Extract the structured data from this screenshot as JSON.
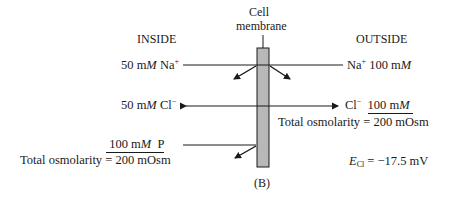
{
  "labels": {
    "inside": "INSIDE",
    "outside": "OUTSIDE",
    "membrane_line1": "Cell",
    "membrane_line2": "membrane",
    "panel": "(B)"
  },
  "inside": {
    "na": {
      "value": "50 m",
      "unit_italic": "M",
      "ion": " Na",
      "charge": "+"
    },
    "cl": {
      "value": "50 m",
      "unit_italic": "M",
      "ion": " Cl",
      "charge": "−"
    },
    "p": {
      "value": "100 m",
      "unit_italic": "M",
      "ion": "  P"
    },
    "osmolarity": "Total osmolarity = 200 mOsm"
  },
  "outside": {
    "na": {
      "ion": "Na",
      "charge": "+",
      "value": " 100 m",
      "unit_italic": "M"
    },
    "cl": {
      "ion": "Cl",
      "charge": "−",
      "value": "100 m",
      "unit_italic": "M"
    },
    "osmolarity": "Total osmolarity = 200 mOsm"
  },
  "potential": {
    "symbol": "E",
    "subscript": "Cl",
    "value": " = −17.5 mV"
  },
  "colors": {
    "membrane_fill": "#b8b8b8",
    "stroke": "#1a1a1a"
  }
}
